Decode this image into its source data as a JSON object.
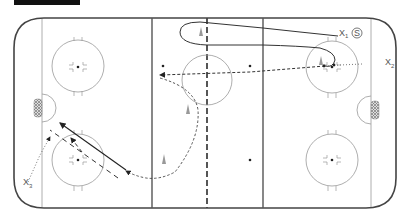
{
  "diagram": {
    "type": "hockey-drill",
    "rink": {
      "board_color": "#444444",
      "line_color": "#555555",
      "circle_color": "#999999"
    },
    "players": [
      {
        "id": "x1",
        "label": "X",
        "sub": "1"
      },
      {
        "id": "x2",
        "label": "X",
        "sub": "2"
      },
      {
        "id": "x3",
        "label": "X",
        "sub": "3"
      }
    ],
    "shooter_badge": "S",
    "elements": {
      "cones": 3,
      "pucks": 5,
      "nets": 2,
      "faceoff_circles": 5
    }
  }
}
